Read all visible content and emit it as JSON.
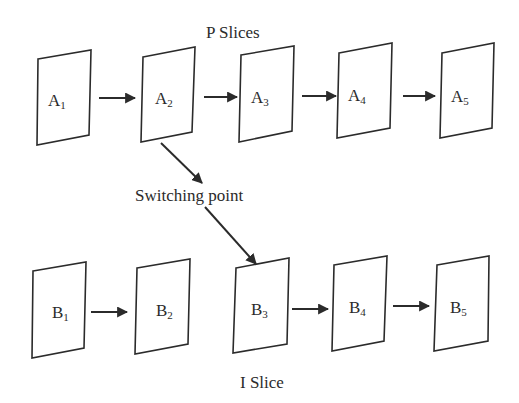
{
  "diagram": {
    "title_top": "P Slices",
    "title_middle": "Switching point",
    "title_bottom": "I Slice",
    "colors": {
      "stroke": "#2b2b2b",
      "background": "#ffffff"
    },
    "p_slices": [
      {
        "letter": "A",
        "index": "1",
        "pts": "38,59 91,50 89,135 37,145",
        "lx": 48,
        "ly": 106
      },
      {
        "letter": "A",
        "index": "2",
        "pts": "143,57 195,47 192,132 141,142",
        "lx": 155,
        "ly": 104
      },
      {
        "letter": "A",
        "index": "3",
        "pts": "241,55 294,46 292,131 239,142",
        "lx": 251,
        "ly": 103
      },
      {
        "letter": "A",
        "index": "4",
        "pts": "339,53 392,43 390,128 337,138",
        "lx": 348,
        "ly": 101
      },
      {
        "letter": "A",
        "index": "5",
        "pts": "442,53 494,43 492,128 440,138",
        "lx": 451,
        "ly": 102
      }
    ],
    "i_slices": [
      {
        "letter": "B",
        "index": "1",
        "pts": "33,271 86,262 84,348 32,358",
        "lx": 52,
        "ly": 318
      },
      {
        "letter": "B",
        "index": "2",
        "pts": "137,268 190,259 188,344 135,354",
        "lx": 156,
        "ly": 316
      },
      {
        "letter": "B",
        "index": "3",
        "pts": "236,268 289,258 287,344 233,353",
        "lx": 251,
        "ly": 315
      },
      {
        "letter": "B",
        "index": "4",
        "pts": "334,265 387,256 384,341 332,351",
        "lx": 349,
        "ly": 313
      },
      {
        "letter": "B",
        "index": "5",
        "pts": "437,265 489,256 488,341 434,351",
        "lx": 450,
        "ly": 313
      }
    ],
    "p_arrows": [
      {
        "x1": 99,
        "y1": 98,
        "x2": 135,
        "y2": 98
      },
      {
        "x1": 204,
        "y1": 97,
        "x2": 237,
        "y2": 97
      },
      {
        "x1": 302,
        "y1": 96,
        "x2": 336,
        "y2": 96
      },
      {
        "x1": 403,
        "y1": 96,
        "x2": 435,
        "y2": 96
      }
    ],
    "i_arrows": [
      {
        "x1": 91,
        "y1": 312,
        "x2": 127,
        "y2": 312
      },
      {
        "x1": 292,
        "y1": 309,
        "x2": 328,
        "y2": 309
      },
      {
        "x1": 393,
        "y1": 306,
        "x2": 429,
        "y2": 306
      }
    ],
    "switch_arrows": [
      {
        "x1": 161,
        "y1": 143,
        "x2": 202,
        "y2": 183
      },
      {
        "x1": 205,
        "y1": 207,
        "x2": 256,
        "y2": 264
      }
    ]
  }
}
